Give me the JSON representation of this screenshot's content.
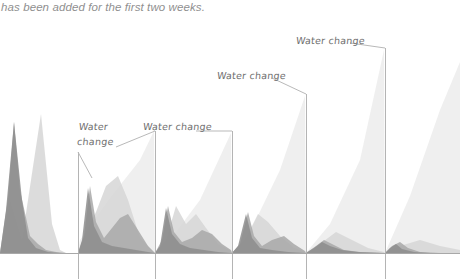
{
  "caption": {
    "text": "has been added for the first two weeks."
  },
  "colors": {
    "background": "#ffffff",
    "caption_text": "#8f8f8f",
    "callout_text": "#6e6e6e",
    "leader_line": "#b9b9b9",
    "marker_line": "#b4b4b4",
    "baseline": "#a8a8a8",
    "series_dark": "#8d8d8d",
    "series_mid": "#a8a8a8",
    "series_light": "#d6d6d6",
    "series_pale": "#ececec"
  },
  "callouts": [
    {
      "id": "callout-1",
      "line1": "Water",
      "line2": "change",
      "label": "Water change"
    },
    {
      "id": "callout-2",
      "line1": "Water change",
      "line2": "",
      "label": "Water change"
    },
    {
      "id": "callout-3",
      "line1": "Water change",
      "line2": "",
      "label": "Water change"
    },
    {
      "id": "callout-4",
      "line1": "Water change",
      "line2": "",
      "label": "Water change"
    }
  ],
  "chart_data": {
    "type": "area",
    "title": "",
    "subtitle": "",
    "xlabel": "",
    "ylabel": "",
    "grid": false,
    "legend": "none",
    "axis": {
      "baseline_y_px": 253,
      "xlim_px": [
        0,
        460
      ],
      "ylim_px": [
        279,
        0
      ]
    },
    "water_change_markers": [
      {
        "x_px": 78,
        "label": "Water change",
        "top_y_px": 152
      },
      {
        "x_px": 155,
        "label": "Water change",
        "top_y_px": 131
      },
      {
        "x_px": 232,
        "label": "Water change",
        "top_y_px": 131
      },
      {
        "x_px": 306,
        "label": "Water change",
        "top_y_px": 94
      },
      {
        "x_px": 385,
        "label": "Water change",
        "top_y_px": 48
      }
    ],
    "series": [
      {
        "name": "pale-ramp",
        "color": "#ececec",
        "points_px": [
          [
            0,
            253
          ],
          [
            6,
            253
          ],
          [
            78,
            253
          ],
          [
            80,
            240
          ],
          [
            110,
            198
          ],
          [
            140,
            160
          ],
          [
            154,
            131
          ],
          [
            155,
            253
          ],
          [
            170,
            240
          ],
          [
            200,
            200
          ],
          [
            231,
            133
          ],
          [
            232,
            253
          ],
          [
            250,
            232
          ],
          [
            280,
            170
          ],
          [
            305,
            96
          ],
          [
            306,
            253
          ],
          [
            330,
            224
          ],
          [
            360,
            160
          ],
          [
            384,
            50
          ],
          [
            385,
            253
          ],
          [
            410,
            196
          ],
          [
            440,
            110
          ],
          [
            460,
            62
          ]
        ]
      },
      {
        "name": "light-ramp",
        "color": "#d6d6d6",
        "points_px": [
          [
            0,
            253
          ],
          [
            10,
            200
          ],
          [
            22,
            240
          ],
          [
            34,
            160
          ],
          [
            41,
            114
          ],
          [
            52,
            224
          ],
          [
            60,
            250
          ],
          [
            66,
            253
          ],
          [
            78,
            253
          ],
          [
            86,
            232
          ],
          [
            96,
            212
          ],
          [
            106,
            186
          ],
          [
            118,
            176
          ],
          [
            128,
            200
          ],
          [
            140,
            238
          ],
          [
            152,
            250
          ],
          [
            155,
            253
          ],
          [
            166,
            240
          ],
          [
            176,
            206
          ],
          [
            186,
            224
          ],
          [
            196,
            214
          ],
          [
            206,
            228
          ],
          [
            218,
            244
          ],
          [
            231,
            251
          ],
          [
            232,
            253
          ],
          [
            246,
            238
          ],
          [
            258,
            214
          ],
          [
            268,
            222
          ],
          [
            280,
            236
          ],
          [
            294,
            248
          ],
          [
            305,
            252
          ],
          [
            306,
            253
          ],
          [
            320,
            244
          ],
          [
            336,
            232
          ],
          [
            352,
            240
          ],
          [
            368,
            248
          ],
          [
            384,
            252
          ],
          [
            385,
            253
          ],
          [
            400,
            246
          ],
          [
            420,
            240
          ],
          [
            440,
            246
          ],
          [
            460,
            250
          ]
        ]
      },
      {
        "name": "mid-tone",
        "color": "#a8a8a8",
        "points_px": [
          [
            0,
            253
          ],
          [
            8,
            198
          ],
          [
            14,
            122
          ],
          [
            20,
            190
          ],
          [
            30,
            236
          ],
          [
            38,
            244
          ],
          [
            46,
            250
          ],
          [
            56,
            252
          ],
          [
            66,
            253
          ],
          [
            78,
            253
          ],
          [
            84,
            236
          ],
          [
            90,
            186
          ],
          [
            96,
            222
          ],
          [
            104,
            238
          ],
          [
            112,
            228
          ],
          [
            120,
            218
          ],
          [
            128,
            214
          ],
          [
            138,
            230
          ],
          [
            148,
            246
          ],
          [
            155,
            253
          ],
          [
            162,
            240
          ],
          [
            168,
            206
          ],
          [
            174,
            232
          ],
          [
            182,
            242
          ],
          [
            192,
            238
          ],
          [
            202,
            230
          ],
          [
            212,
            234
          ],
          [
            222,
            244
          ],
          [
            231,
            250
          ],
          [
            232,
            253
          ],
          [
            240,
            244
          ],
          [
            248,
            212
          ],
          [
            254,
            236
          ],
          [
            262,
            246
          ],
          [
            272,
            240
          ],
          [
            284,
            236
          ],
          [
            294,
            244
          ],
          [
            305,
            251
          ],
          [
            306,
            253
          ],
          [
            316,
            246
          ],
          [
            324,
            240
          ],
          [
            332,
            244
          ],
          [
            344,
            250
          ],
          [
            360,
            252
          ],
          [
            384,
            253
          ],
          [
            385,
            253
          ],
          [
            392,
            246
          ],
          [
            400,
            242
          ],
          [
            408,
            248
          ],
          [
            420,
            252
          ],
          [
            440,
            253
          ],
          [
            460,
            253
          ]
        ]
      },
      {
        "name": "dark-peaks",
        "color": "#8d8d8d",
        "points_px": [
          [
            0,
            253
          ],
          [
            6,
            210
          ],
          [
            14,
            122
          ],
          [
            22,
            200
          ],
          [
            28,
            238
          ],
          [
            36,
            248
          ],
          [
            48,
            252
          ],
          [
            60,
            253
          ],
          [
            78,
            253
          ],
          [
            82,
            240
          ],
          [
            88,
            188
          ],
          [
            94,
            226
          ],
          [
            102,
            242
          ],
          [
            112,
            246
          ],
          [
            124,
            248
          ],
          [
            136,
            250
          ],
          [
            148,
            252
          ],
          [
            155,
            253
          ],
          [
            160,
            246
          ],
          [
            166,
            208
          ],
          [
            172,
            234
          ],
          [
            180,
            244
          ],
          [
            190,
            248
          ],
          [
            204,
            250
          ],
          [
            218,
            252
          ],
          [
            231,
            253
          ],
          [
            232,
            253
          ],
          [
            238,
            246
          ],
          [
            246,
            214
          ],
          [
            252,
            238
          ],
          [
            260,
            248
          ],
          [
            272,
            250
          ],
          [
            288,
            252
          ],
          [
            305,
            253
          ],
          [
            306,
            253
          ],
          [
            314,
            248
          ],
          [
            322,
            242
          ],
          [
            330,
            246
          ],
          [
            342,
            250
          ],
          [
            358,
            252
          ],
          [
            384,
            253
          ],
          [
            385,
            253
          ],
          [
            390,
            248
          ],
          [
            396,
            244
          ],
          [
            402,
            249
          ],
          [
            414,
            252
          ],
          [
            430,
            253
          ],
          [
            460,
            253
          ]
        ]
      }
    ]
  }
}
